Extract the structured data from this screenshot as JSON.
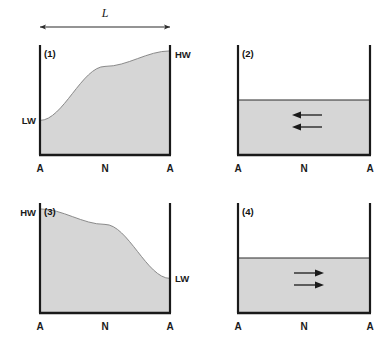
{
  "figure": {
    "type": "scientific-diagram",
    "colors": {
      "water_fill": "#d6d6d6",
      "water_surface_line": "#2b2b2b",
      "wall": "#1a1a1a",
      "background": "#ffffff",
      "arrow": "#1a1a1a"
    },
    "dimension": {
      "label": "L",
      "style": "double-headed-arrow",
      "spans_panel": 1
    },
    "axis_labels": [
      "A",
      "N",
      "A"
    ],
    "panels": [
      {
        "id": "panel-1",
        "label": "(1)",
        "surface": "sloping-up",
        "left_level_label": "LW",
        "left_level_value": 0.22,
        "right_level_label": "HW",
        "right_level_value": 0.82,
        "arrows": [],
        "axis_labels": [
          "A",
          "N",
          "A"
        ]
      },
      {
        "id": "panel-2",
        "label": "(2)",
        "surface": "flat",
        "left_level_label": "",
        "left_level_value": 0.5,
        "right_level_label": "",
        "right_level_value": 0.5,
        "arrows": [
          {
            "direction": "left",
            "row": 0
          },
          {
            "direction": "left",
            "row": 1
          }
        ],
        "axis_labels": [
          "A",
          "N",
          "A"
        ]
      },
      {
        "id": "panel-3",
        "label": "(3)",
        "surface": "sloping-down",
        "left_level_label": "HW",
        "left_level_value": 0.82,
        "right_level_label": "LW",
        "right_level_value": 0.22,
        "arrows": [],
        "axis_labels": [
          "A",
          "N",
          "A"
        ]
      },
      {
        "id": "panel-4",
        "label": "(4)",
        "surface": "flat",
        "left_level_label": "",
        "left_level_value": 0.5,
        "right_level_label": "",
        "right_level_value": 0.5,
        "arrows": [
          {
            "direction": "right",
            "row": 0
          },
          {
            "direction": "right",
            "row": 1
          }
        ],
        "axis_labels": [
          "A",
          "N",
          "A"
        ]
      }
    ]
  }
}
